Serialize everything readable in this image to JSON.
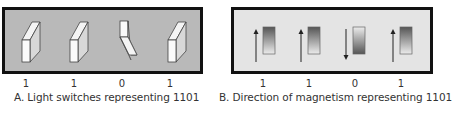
{
  "panel_a": {
    "caption": "A. Light switches representing 1101",
    "background": "#b9b9b9",
    "switches": [
      {
        "state": "up",
        "bit": "1"
      },
      {
        "state": "up",
        "bit": "1"
      },
      {
        "state": "down",
        "bit": "0"
      },
      {
        "state": "up",
        "bit": "1"
      }
    ]
  },
  "panel_b": {
    "caption": "B. Direction of magnetism representing 1101",
    "background": "#e4e4e4",
    "magnets": [
      {
        "arrow": "up",
        "bit": "1"
      },
      {
        "arrow": "up",
        "bit": "1"
      },
      {
        "arrow": "down",
        "bit": "0"
      },
      {
        "arrow": "up",
        "bit": "1"
      }
    ]
  }
}
